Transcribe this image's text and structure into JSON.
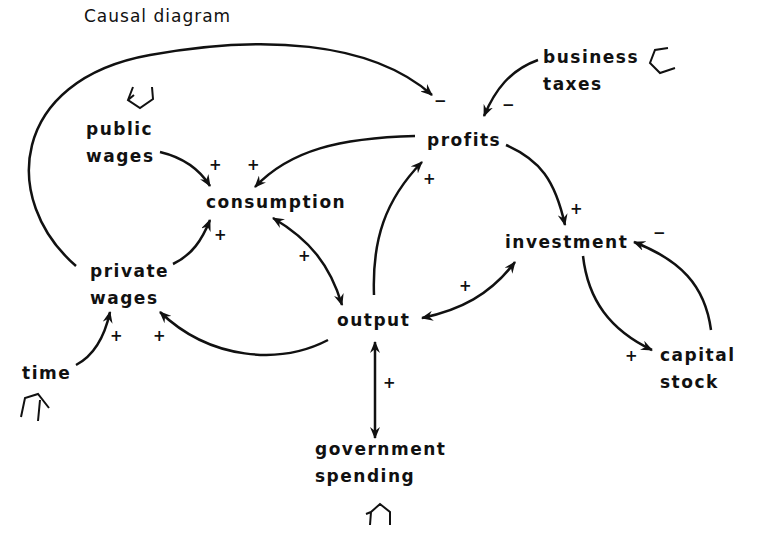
{
  "title": "Causal diagram",
  "nodes": {
    "public_wages": {
      "line1": "public",
      "line2": "wages"
    },
    "consumption": {
      "label": "consumption"
    },
    "profits": {
      "label": "profits"
    },
    "business_taxes": {
      "line1": "business",
      "line2": "taxes"
    },
    "investment": {
      "label": "investment"
    },
    "private_wages": {
      "line1": "private",
      "line2": "wages"
    },
    "output": {
      "label": "output"
    },
    "capital_stock": {
      "line1": "capital",
      "line2": "stock"
    },
    "time": {
      "label": "time"
    },
    "government_spending": {
      "line1": "government",
      "line2": "spending"
    }
  },
  "edges": [
    {
      "from": "public wages",
      "to": "consumption",
      "sign": "+"
    },
    {
      "from": "profits",
      "to": "consumption",
      "sign": "+"
    },
    {
      "from": "private wages",
      "to": "consumption",
      "sign": "+"
    },
    {
      "from": "private wages",
      "to": "profits",
      "sign": "−"
    },
    {
      "from": "business taxes",
      "to": "profits",
      "sign": "−"
    },
    {
      "from": "output",
      "to": "profits",
      "sign": "+"
    },
    {
      "from": "profits",
      "to": "investment",
      "sign": "+"
    },
    {
      "from": "consumption",
      "to": "output",
      "sign": "+",
      "bidirectional": true
    },
    {
      "from": "output",
      "to": "investment",
      "sign": "+",
      "bidirectional": true
    },
    {
      "from": "output",
      "to": "private wages",
      "sign": "+"
    },
    {
      "from": "time",
      "to": "private wages",
      "sign": "+"
    },
    {
      "from": "government spending",
      "to": "output",
      "sign": "+",
      "bidirectional": true
    },
    {
      "from": "investment",
      "to": "capital stock",
      "sign": "+"
    },
    {
      "from": "capital stock",
      "to": "investment",
      "sign": "−"
    }
  ],
  "signs": {
    "plus": "+",
    "minus": "−"
  },
  "exogenous_markers": [
    "public wages",
    "business taxes",
    "time",
    "government spending"
  ]
}
